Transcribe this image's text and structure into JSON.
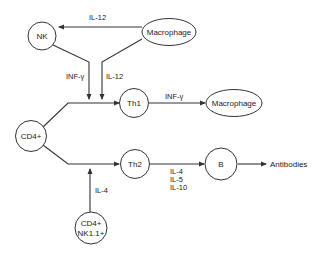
{
  "nodes": {
    "nk": {
      "label": "NK"
    },
    "macrophage_top": {
      "label": "Macrophage"
    },
    "th1": {
      "label": "Th1"
    },
    "macrophage_right": {
      "label": "Macrophage"
    },
    "cd4": {
      "label": "CD4+"
    },
    "th2": {
      "label": "Th2"
    },
    "b": {
      "label": "B"
    },
    "cd4_nk_line1": {
      "label": "CD4+"
    },
    "cd4_nk_line2": {
      "label": "NK1.1+"
    },
    "antibodies": {
      "label": "Antibodies"
    }
  },
  "edge_labels": {
    "macrophage_to_nk": "IL-12",
    "nk_to_th1": "INF-γ",
    "macrophage_to_th1": "IL-12",
    "th1_to_macrophage": "INF-γ",
    "cd4nk_to_th2": "IL-4",
    "th2_to_b": [
      "IL-4",
      "IL-5",
      "IL-10"
    ]
  },
  "colors": {
    "stroke": "#333333",
    "text": "#222222",
    "background": "#ffffff"
  }
}
